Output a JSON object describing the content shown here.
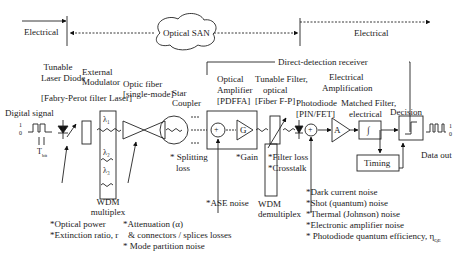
{
  "domains": {
    "electrical_left": "Electrical",
    "optical_san": "Optical  SAN",
    "electrical_right": "Electrical",
    "receiver_title": "Direct-detection receiver"
  },
  "components": {
    "laser": {
      "line1": "Tunable",
      "line2": "Laser Diode",
      "note": "[Fabry-Perot filter Laser]"
    },
    "modulator": {
      "line1": "External",
      "line2": "Modulator"
    },
    "fiber": {
      "line1": "Optic fiber",
      "line2": "[single-mode]"
    },
    "coupler": {
      "line1": "Star",
      "line2": "Coupler"
    },
    "amplifier": {
      "line1": "Optical",
      "line2": "Amplifier",
      "line3": "[PDFFA]",
      "gain_symbol": "G",
      "sum_symbol": "+"
    },
    "filter": {
      "line1": "Tunable Filter,",
      "line2": "optical",
      "line3": "[Fiber F-P]"
    },
    "electrical_amp": {
      "line1": "Electrical",
      "line2": "Amplification",
      "symbol": "A"
    },
    "photodiode": {
      "line1": "Photodiode",
      "line2": "[PIN/FET]",
      "sum_symbol": "+"
    },
    "matched_filter": {
      "line1": "Matched Filter,",
      "line2": "electrical",
      "symbol": "∫"
    },
    "decision": {
      "label": "Decision"
    },
    "timing": {
      "label": "Timing"
    },
    "wdm_mux": {
      "line1": "WDM",
      "line2": "multiplex",
      "l1": "λ₁",
      "l2": "λ₂",
      "l3": "λ₃"
    },
    "wdm_demux": {
      "line1": "WDM",
      "line2": "demultiplex"
    }
  },
  "signals": {
    "input_label": "Digital signal",
    "one": "1",
    "zero": "0",
    "tbit": "T",
    "tbit_sub": "bit",
    "output_label": "Data out"
  },
  "impairments": {
    "transmitter": [
      "*Optical power",
      "*Extinction ratio, r"
    ],
    "fiber": [
      "*Attenuation (α)",
      "& connectors / splices losses",
      "* Mode partition noise"
    ],
    "coupler": [
      "* Splitting",
      "loss"
    ],
    "amplifier_gain": "*Gain",
    "amplifier_noise": "*ASE noise",
    "filter": [
      "*Filter loss",
      "*Crosstalk"
    ],
    "receiver": [
      "*Dark current noise",
      "*Shot (quantum) noise",
      "*Thermal (Johnson) noise",
      "*Electronic amplifier noise",
      "* Photodiode quantum efficiency, η"
    ],
    "qe_sub": "QE"
  }
}
